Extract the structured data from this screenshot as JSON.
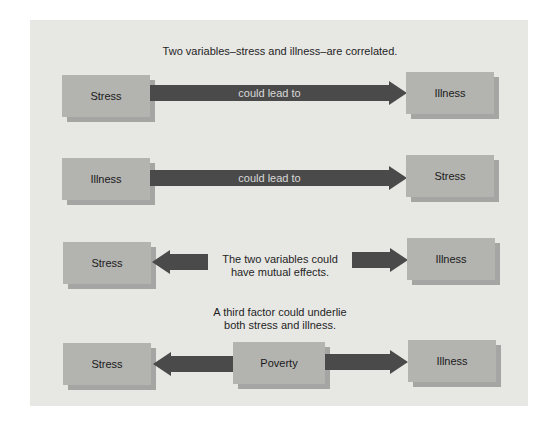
{
  "colors": {
    "panel": "#e7e7e4",
    "box_face": "#b3b3b0",
    "box_shadow": "#a5a5a3",
    "arrow": "#4a4a4a"
  },
  "rows": [
    {
      "caption": "Two variables–stress and illness–are correlated.",
      "left_box": "Stress",
      "arrow_label": "could lead to",
      "right_box": "Illness"
    },
    {
      "left_box": "Illness",
      "arrow_label": "could lead to",
      "right_box": "Stress"
    },
    {
      "left_box": "Stress",
      "center_text_line1": "The two variables could",
      "center_text_line2": "have mutual effects.",
      "right_box": "Illness"
    },
    {
      "caption_line1": "A third factor could underlie",
      "caption_line2": "both stress and illness.",
      "left_box": "Stress",
      "center_box": "Poverty",
      "right_box": "Illness"
    }
  ]
}
